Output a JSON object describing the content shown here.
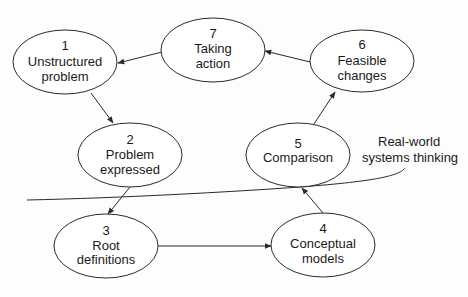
{
  "diagram": {
    "colors": {
      "stroke": "#2a2a2a",
      "text": "#1a1a1a",
      "background": "#fdfdfd"
    },
    "nodes": [
      {
        "id": "1",
        "number": "1",
        "line1": "Unstructured",
        "line2": "problem",
        "cx": 65,
        "cy": 62
      },
      {
        "id": "2",
        "number": "2",
        "line1": "Problem",
        "line2": "expressed",
        "cx": 130,
        "cy": 163
      },
      {
        "id": "3",
        "number": "3",
        "line1": "Root",
        "line2": "definitions",
        "cx": 106,
        "cy": 245
      },
      {
        "id": "4",
        "number": "4",
        "line1": "Conceptual",
        "line2": "models",
        "cx": 324,
        "cy": 244
      },
      {
        "id": "5",
        "number": "5",
        "line1": "Comparison",
        "line2": "",
        "cx": 298,
        "cy": 157
      },
      {
        "id": "6",
        "number": "6",
        "line1": "Feasible",
        "line2": "changes",
        "cx": 362,
        "cy": 59
      },
      {
        "id": "7",
        "number": "7",
        "line1": "Taking",
        "line2": "action",
        "cx": 213,
        "cy": 50
      }
    ],
    "edges": [
      {
        "from": "1",
        "to": "2"
      },
      {
        "from": "2",
        "to": "3"
      },
      {
        "from": "3",
        "to": "4"
      },
      {
        "from": "4",
        "to": "5"
      },
      {
        "from": "5",
        "to": "6"
      },
      {
        "from": "6",
        "to": "7"
      },
      {
        "from": "7",
        "to": "1"
      }
    ],
    "boundary": {
      "label_line1": "Real-world",
      "label_line2": "systems thinking"
    }
  }
}
